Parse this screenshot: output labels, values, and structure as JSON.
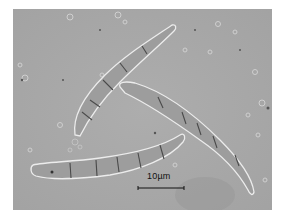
{
  "figure": {
    "background_color": "#a9a9a9",
    "spore_color": "#9a9a9a",
    "outline_color": "#e8e8e8",
    "septum_color": "#4a4a4a"
  },
  "scale_bar": {
    "label": "10µm",
    "color": "#111111"
  },
  "spores": [
    {
      "name": "upper-left spore",
      "septa": 5
    },
    {
      "name": "right spore",
      "septa": 5
    },
    {
      "name": "lower spore",
      "septa": 5
    }
  ]
}
